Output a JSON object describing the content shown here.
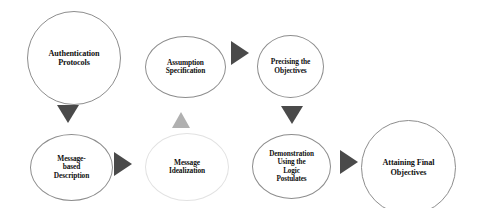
{
  "diagram": {
    "type": "flowchart",
    "background_color": "#ffffff",
    "node_fill_color": "#ffffff",
    "node_border_color": "#8d8d8d",
    "node_border_color_faint": "#e2e2e2",
    "text_color": "#111111",
    "arrow_color_dark": "#4a4a4a",
    "arrow_color_light": "#b0b0b0",
    "nodes": [
      {
        "id": "authentication-protocols",
        "label": "Authentication\nProtocols",
        "shape": "circle",
        "x": 27,
        "y": 11,
        "width": 94,
        "height": 94,
        "font_size": 8.2,
        "border": "strong"
      },
      {
        "id": "assumption-specification",
        "label": "Assumption\nSpecification",
        "shape": "ellipse",
        "x": 145,
        "y": 36,
        "width": 81,
        "height": 62,
        "font_size": 7.4,
        "border": "strong"
      },
      {
        "id": "precising-the-objectives",
        "label": "Precising the\nObjectives",
        "shape": "ellipse",
        "x": 257,
        "y": 35,
        "width": 67,
        "height": 63,
        "font_size": 7.4,
        "border": "strong"
      },
      {
        "id": "message-based-description",
        "label": "Message-\nbased\nDescription",
        "shape": "ellipse",
        "x": 30,
        "y": 134,
        "width": 83,
        "height": 67,
        "font_size": 7.4,
        "border": "strong"
      },
      {
        "id": "message-idealization",
        "label": "Message\nIdealization",
        "shape": "circle",
        "x": 145,
        "y": 133,
        "width": 84,
        "height": 68,
        "font_size": 7.4,
        "border": "faint"
      },
      {
        "id": "demonstration-using-the-logic-postulates",
        "label": "Demonstration\nUsing the\nLogic\nPostulates",
        "shape": "ellipse",
        "x": 252,
        "y": 134,
        "width": 79,
        "height": 65,
        "font_size": 7.2,
        "border": "strong"
      },
      {
        "id": "attaining-final-objectives",
        "label": "Attaining Final\nObjectives",
        "shape": "circle",
        "x": 361,
        "y": 120,
        "width": 95,
        "height": 95,
        "font_size": 8.2,
        "border": "strong"
      }
    ],
    "arrows": [
      {
        "id": "authentication-to-message-based",
        "from": "authentication-protocols",
        "to": "message-based-description",
        "direction": "down",
        "color": "#4a4a4a",
        "x": 57,
        "y": 105,
        "size": 18
      },
      {
        "id": "assumption-to-precising",
        "from": "assumption-specification",
        "to": "precising-the-objectives",
        "direction": "right",
        "color": "#4a4a4a",
        "x": 231,
        "y": 41,
        "size": 18
      },
      {
        "id": "message-idealization-to-assumption",
        "from": "message-idealization",
        "to": "assumption-specification",
        "direction": "up",
        "color": "#b0b0b0",
        "x": 172,
        "y": 112,
        "size": 16
      },
      {
        "id": "precising-to-demonstration",
        "from": "precising-the-objectives",
        "to": "demonstration-using-the-logic-postulates",
        "direction": "down",
        "color": "#4a4a4a",
        "x": 281,
        "y": 106,
        "size": 18
      },
      {
        "id": "message-based-to-message-idealization",
        "from": "message-based-description",
        "to": "message-idealization",
        "direction": "right",
        "color": "#4a4a4a",
        "x": 114,
        "y": 152,
        "size": 18
      },
      {
        "id": "demonstration-to-attaining",
        "from": "demonstration-using-the-logic-postulates",
        "to": "attaining-final-objectives",
        "direction": "right",
        "color": "#4a4a4a",
        "x": 340,
        "y": 150,
        "size": 18
      }
    ]
  }
}
